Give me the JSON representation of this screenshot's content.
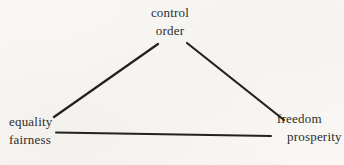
{
  "diagram": {
    "nodes": {
      "top": {
        "line1": "control",
        "line2": "order"
      },
      "bottom_left": {
        "line1": "equality",
        "line2": "fairness"
      },
      "bottom_right": {
        "line1": "freedom",
        "line2": "prosperity"
      }
    },
    "edges": [
      {
        "from": "control-order",
        "to": "equality-fairness"
      },
      {
        "from": "control-order",
        "to": "freedom-prosperity"
      },
      {
        "from": "equality-fairness",
        "to": "freedom-prosperity"
      }
    ],
    "colors": {
      "background": "#f8f7f4",
      "line": "#23211f",
      "text": "#2e2c29"
    }
  }
}
